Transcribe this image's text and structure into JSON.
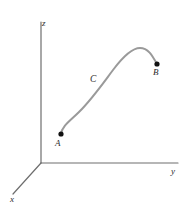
{
  "figure": {
    "background_color": "#ffffff",
    "width": 193,
    "height": 210,
    "axis_color": "#6e6e6e",
    "curve_color": "#9a9a9a",
    "point_color": "#111111",
    "label_color": "#2b2b2b",
    "axes": {
      "origin": {
        "x": 41,
        "y": 163
      },
      "items": [
        {
          "name": "z",
          "label": "z",
          "label_x": 42,
          "label_y": 19,
          "from": {
            "x": 41,
            "y": 163
          },
          "to": {
            "x": 41,
            "y": 22
          }
        },
        {
          "name": "y",
          "label": "y",
          "label_x": 171,
          "label_y": 167,
          "from": {
            "x": 41,
            "y": 163
          },
          "to": {
            "x": 178,
            "y": 163
          }
        },
        {
          "name": "x",
          "label": "x",
          "label_x": 10,
          "label_y": 195,
          "from": {
            "x": 41,
            "y": 163
          },
          "to": {
            "x": 13,
            "y": 194
          }
        }
      ]
    },
    "curve": {
      "name": "C",
      "label": "C",
      "label_x": 90,
      "label_y": 75,
      "stroke_width": 2,
      "path": "M 61 134 C 62 126, 70 121, 79 112 C 92 99, 101 86, 113 70 C 122 58, 131 48, 140 48 C 148 48, 152 55, 157 64",
      "points": [
        {
          "name": "A",
          "label": "A",
          "x": 61,
          "y": 134,
          "label_x": 55,
          "label_y": 139
        },
        {
          "name": "B",
          "label": "B",
          "x": 157,
          "y": 64,
          "label_x": 153,
          "label_y": 68
        }
      ]
    }
  },
  "chart_data": {
    "type": "line",
    "title": "",
    "xlabel": "y",
    "ylabel": "z",
    "zlabel": "x",
    "legend": [],
    "grid": false,
    "annotations": [
      "A",
      "B",
      "C",
      "x",
      "y",
      "z"
    ],
    "series": [
      {
        "name": "C",
        "description": "Smooth oriented space curve from point A to point B",
        "endpoints": [
          "A",
          "B"
        ]
      }
    ]
  }
}
